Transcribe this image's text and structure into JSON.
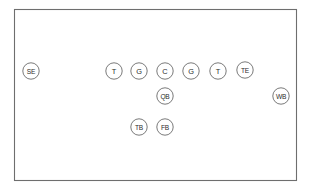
{
  "diagram": {
    "field": {
      "x": 14.5,
      "y": 9.5,
      "width": 282,
      "height": 171,
      "border_color": "#6e6e6e",
      "background_color": "#ffffff"
    },
    "circle_style": {
      "radius": 8.2,
      "stroke_color": "#7a7a7a",
      "fill_color": "#ffffff",
      "text_color": "#2b2b2b"
    },
    "players": [
      {
        "label": "SE",
        "name": "split-end",
        "cx": 31,
        "cy": 71
      },
      {
        "label": "T",
        "name": "left-tackle",
        "cx": 114,
        "cy": 71
      },
      {
        "label": "G",
        "name": "left-guard",
        "cx": 139,
        "cy": 71
      },
      {
        "label": "C",
        "name": "center",
        "cx": 165,
        "cy": 71
      },
      {
        "label": "G",
        "name": "right-guard",
        "cx": 191,
        "cy": 71
      },
      {
        "label": "T",
        "name": "right-tackle",
        "cx": 218,
        "cy": 71
      },
      {
        "label": "TE",
        "name": "tight-end",
        "cx": 245,
        "cy": 70
      },
      {
        "label": "QB",
        "name": "quarterback",
        "cx": 165,
        "cy": 96
      },
      {
        "label": "WB",
        "name": "wingback",
        "cx": 281,
        "cy": 96
      },
      {
        "label": "TB",
        "name": "tailback",
        "cx": 139,
        "cy": 127
      },
      {
        "label": "FB",
        "name": "fullback",
        "cx": 165,
        "cy": 127
      }
    ]
  }
}
